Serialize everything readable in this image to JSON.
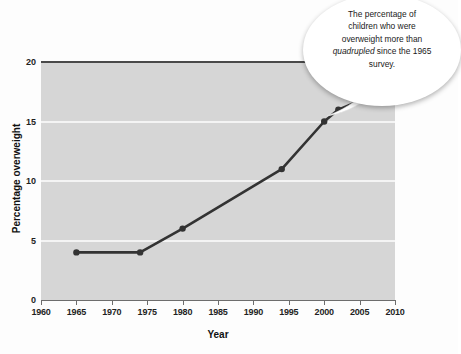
{
  "chart_data": {
    "type": "line",
    "title": "",
    "xlabel": "Year",
    "ylabel": "Percentage overweight",
    "xlim": [
      1960,
      2010
    ],
    "ylim": [
      0,
      20
    ],
    "xticks": [
      1960,
      1965,
      1970,
      1975,
      1980,
      1985,
      1990,
      1995,
      2000,
      2005,
      2010
    ],
    "yticks": [
      0,
      5,
      10,
      15,
      20
    ],
    "grid": "horizontal-white",
    "legend": "none",
    "series": [
      {
        "name": "Percentage overweight",
        "color": "#333333",
        "marker": "circle",
        "x": [
          1965,
          1974,
          1980,
          1994,
          2000,
          2002,
          2006
        ],
        "values": [
          4,
          4,
          6,
          11,
          15,
          16,
          17
        ]
      }
    ],
    "annotations": [
      {
        "id": "callout",
        "text_line_1": "The percentage of",
        "text_line_2": "children who were",
        "text_line_3": "overweight more than",
        "text_line_4_pre": "",
        "text_line_4_emphasis": "quadrupled",
        "text_line_4_post": " since the 1965",
        "text_line_5": "survey.",
        "points_to_year": 2006,
        "points_to_value": 17
      }
    ]
  },
  "axes": {
    "x_title": "Year",
    "y_title": "Percentage overweight",
    "x_tick_labels": [
      "1960",
      "1965",
      "1970",
      "1975",
      "1980",
      "1985",
      "1990",
      "1995",
      "2000",
      "2005",
      "2010"
    ],
    "y_tick_labels": [
      "0",
      "5",
      "10",
      "15",
      "20"
    ]
  },
  "callout": {
    "line1": "The percentage of",
    "line2": "children who were",
    "line3": "overweight more than",
    "emphasis": "quadrupled",
    "line4_tail": " since the 1965",
    "line5": "survey."
  },
  "colors": {
    "plot_background": "#d6d6d6",
    "gridline": "#f4f4f4",
    "series_line": "#333333",
    "axis": "#6d6d6d",
    "page_background": "#fdfdfd",
    "callout_fill": "#ffffff"
  }
}
